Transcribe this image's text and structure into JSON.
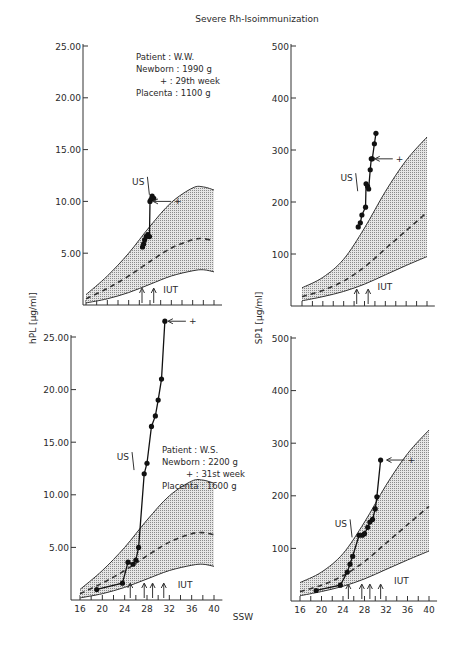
{
  "chart_data": {
    "title": "Severe Rh-Isoimmunization",
    "xlabel": "SSW",
    "x_ticks": [
      16,
      20,
      24,
      28,
      32,
      36,
      40
    ],
    "xlim": [
      16,
      41
    ],
    "panels": [
      {
        "id": "hpl-ww",
        "type": "line",
        "ylabel": "hPL [µg/ml]",
        "ylim": [
          0,
          25
        ],
        "y_ticks": [
          5,
          10,
          15,
          20,
          25
        ],
        "y_tick_labels": [
          "5.00",
          "10.00",
          "15.00",
          "20.00",
          "25.00"
        ],
        "info": [
          "Patient  : W.W.",
          "Newborn : 1990 g",
          "+ : 29th week",
          "Placenta : 1100 g"
        ],
        "normal_band": {
          "x": [
            16,
            20,
            24,
            28,
            32,
            36,
            38,
            40
          ],
          "upper": [
            1.0,
            2.8,
            5.0,
            7.6,
            9.9,
            11.3,
            11.4,
            11.1
          ],
          "mean": [
            0.6,
            1.6,
            2.8,
            4.2,
            5.5,
            6.3,
            6.4,
            6.2
          ],
          "lower": [
            0.2,
            0.6,
            1.2,
            2.0,
            2.8,
            3.3,
            3.4,
            3.2
          ]
        },
        "series": [
          {
            "name": "patient",
            "x": [
              26.6,
              26.8,
              27.0,
              27.3,
              27.6,
              27.9,
              28.0,
              28.2,
              28.4,
              28.7
            ],
            "y": [
              5.6,
              5.9,
              6.3,
              6.6,
              6.8,
              6.6,
              10.0,
              10.2,
              10.5,
              10.3
            ]
          }
        ],
        "annotations": [
          {
            "text": "US",
            "x": 27.7,
            "y": 11.6
          },
          {
            "text": "+",
            "x": 32.5,
            "y": 10.0
          },
          {
            "text": "IUT",
            "x": 30.5,
            "y": 0.6
          }
        ],
        "iut_weeks": [
          26.5,
          28.7
        ]
      },
      {
        "id": "sp-ww",
        "type": "line",
        "ylabel": "SP1 [µg/ml]",
        "ylim": [
          0,
          500
        ],
        "y_ticks": [
          100,
          200,
          300,
          400,
          500
        ],
        "y_tick_labels": [
          "100",
          "200",
          "300",
          "400",
          "500"
        ],
        "normal_band": {
          "x": [
            16,
            20,
            24,
            28,
            32,
            36,
            40
          ],
          "upper": [
            35,
            55,
            90,
            150,
            220,
            280,
            325
          ],
          "mean": [
            18,
            30,
            48,
            75,
            110,
            145,
            180
          ],
          "lower": [
            10,
            18,
            28,
            42,
            60,
            78,
            95
          ]
        },
        "series": [
          {
            "name": "patient",
            "x": [
              26.8,
              27.2,
              27.5,
              28.2,
              28.3,
              28.6,
              28.8,
              29.1,
              29.3,
              29.5,
              29.9,
              30.2
            ],
            "y": [
              152,
              160,
              175,
              190,
              235,
              230,
              225,
              262,
              283,
              283,
              312,
              332
            ]
          }
        ],
        "annotations": [
          {
            "text": "US",
            "x": 26.5,
            "y": 240
          },
          {
            "text": "+",
            "x": 34.0,
            "y": 283
          },
          {
            "text": "IUT",
            "x": 30.5,
            "y": 20
          }
        ],
        "iut_weeks": [
          26.5,
          28.7
        ]
      },
      {
        "id": "hpl-ws",
        "type": "line",
        "ylabel": "hPL [µg/ml]",
        "ylim": [
          0,
          25
        ],
        "y_ticks": [
          5,
          10,
          15,
          20,
          25
        ],
        "y_tick_labels": [
          "5.00",
          "10.00",
          "15.00",
          "20.00",
          "25.00"
        ],
        "info": [
          "Patient  : W.S.",
          "Newborn : 2200 g",
          "+ : 31st week",
          "Placenta : 1600 g"
        ],
        "normal_band": {
          "x": [
            16,
            20,
            24,
            28,
            32,
            36,
            38,
            40
          ],
          "upper": [
            1.0,
            2.8,
            5.0,
            7.6,
            9.9,
            11.3,
            11.4,
            11.1
          ],
          "mean": [
            0.6,
            1.6,
            2.8,
            4.2,
            5.5,
            6.3,
            6.4,
            6.2
          ],
          "lower": [
            0.2,
            0.6,
            1.2,
            2.0,
            2.8,
            3.3,
            3.4,
            3.2
          ]
        },
        "series": [
          {
            "name": "patient",
            "x": [
              19.0,
              23.6,
              24.6,
              25.5,
              26.0,
              26.5,
              27.5,
              28.0,
              28.8,
              29.5,
              30.0,
              30.6,
              31.2
            ],
            "y": [
              1.0,
              1.6,
              3.6,
              3.4,
              3.8,
              5.0,
              12.0,
              13.0,
              16.5,
              17.5,
              19.0,
              21.0,
              26.5
            ]
          }
        ],
        "annotations": [
          {
            "text": "US",
            "x": 25.5,
            "y": 13.3
          },
          {
            "text": "+",
            "x": 35.5,
            "y": 26.5
          },
          {
            "text": "IUT",
            "x": 33.5,
            "y": 0.6
          }
        ],
        "iut_weeks": [
          25.0,
          27.5,
          29.0,
          31.0
        ]
      },
      {
        "id": "sp-ws",
        "type": "line",
        "ylabel": "SP1 [µg/ml]",
        "ylim": [
          0,
          500
        ],
        "y_ticks": [
          100,
          200,
          300,
          400,
          500
        ],
        "y_tick_labels": [
          "100",
          "200",
          "300",
          "400",
          "500"
        ],
        "normal_band": {
          "x": [
            16,
            20,
            24,
            28,
            32,
            36,
            40
          ],
          "upper": [
            35,
            55,
            90,
            150,
            220,
            280,
            325
          ],
          "mean": [
            18,
            30,
            48,
            75,
            110,
            145,
            180
          ],
          "lower": [
            10,
            18,
            28,
            42,
            60,
            78,
            95
          ]
        },
        "series": [
          {
            "name": "patient",
            "x": [
              19.0,
              23.5,
              24.8,
              25.3,
              25.8,
              27.0,
              27.6,
              28.0,
              28.6,
              29.0,
              29.5,
              30.0,
              30.3,
              31.0
            ],
            "y": [
              20,
              30,
              55,
              70,
              85,
              125,
              125,
              128,
              140,
              150,
              155,
              175,
              198,
              268
            ]
          }
        ],
        "annotations": [
          {
            "text": "US",
            "x": 25.5,
            "y": 140
          },
          {
            "text": "+",
            "x": 36.0,
            "y": 268
          },
          {
            "text": "IUT",
            "x": 33.5,
            "y": 20
          }
        ],
        "iut_weeks": [
          25.0,
          27.5,
          29.0,
          31.0
        ]
      }
    ]
  }
}
